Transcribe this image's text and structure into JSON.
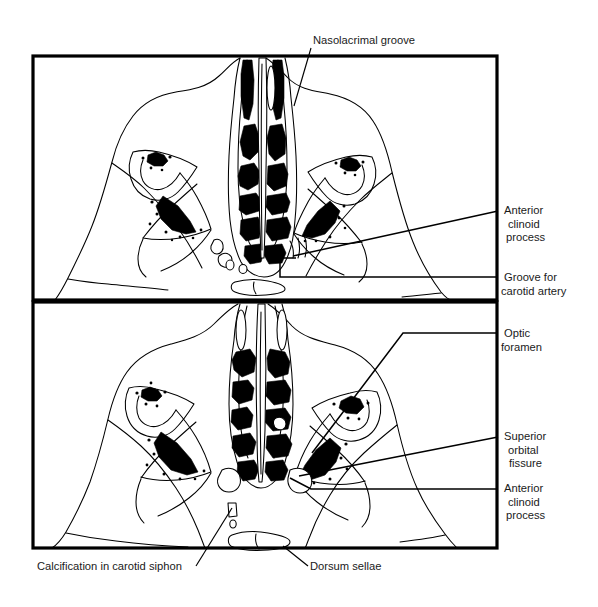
{
  "figure": {
    "background_color": "#ffffff",
    "ink_color": "#000000",
    "panel_count": 2
  },
  "panels": [
    {
      "id": "upper-panel",
      "name": "upper-axial-section",
      "frame": {
        "x": 33,
        "y": 56,
        "width": 464,
        "height": 244
      }
    },
    {
      "id": "lower-panel",
      "name": "lower-axial-section",
      "frame": {
        "x": 33,
        "y": 302,
        "width": 464,
        "height": 246
      }
    }
  ],
  "labels": {
    "nasolacrimal_groove": {
      "text": "Nasolacrimal groove",
      "lines": [
        "Nasolacrimal groove"
      ],
      "anchor": "start",
      "x": 313,
      "y": 44,
      "panel": "upper-panel"
    },
    "anterior_clinoid_process_upper": {
      "text": "Anterior clinoid process",
      "lines": [
        "Anterior",
        "clinoid",
        "process"
      ],
      "anchor": "start",
      "x": 504,
      "y": 214,
      "panel": "upper-panel"
    },
    "groove_for_carotid_artery": {
      "text": "Groove for carotid artery",
      "lines": [
        "Groove for",
        "carotid artery"
      ],
      "anchor": "start",
      "x": 504,
      "y": 281,
      "panel": "upper-panel"
    },
    "optic_foramen": {
      "text": "Optic foramen",
      "lines": [
        "Optic",
        "foramen"
      ],
      "anchor": "start",
      "x": 504,
      "y": 337,
      "panel": "lower-panel"
    },
    "superior_orbital_fissure": {
      "text": "Superior orbital fissure",
      "lines": [
        "Superior",
        "orbital",
        "fissure"
      ],
      "anchor": "start",
      "x": 504,
      "y": 440,
      "panel": "lower-panel"
    },
    "anterior_clinoid_process_lower": {
      "text": "Anterior clinoid process",
      "lines": [
        "Anterior",
        "clinoid",
        "process"
      ],
      "anchor": "start",
      "x": 504,
      "y": 492,
      "panel": "lower-panel"
    },
    "calcification_in_carotid_siphon": {
      "text": "Calcification in carotid siphon",
      "lines": [
        "Calcification in carotid siphon"
      ],
      "anchor": "start",
      "x": 37,
      "y": 570,
      "panel": "lower-panel"
    },
    "dorsum_sellae": {
      "text": "Dorsum sellae",
      "lines": [
        "Dorsum sellae"
      ],
      "anchor": "start",
      "x": 310,
      "y": 570,
      "panel": "lower-panel"
    }
  },
  "leader_lines": {
    "nasolacrimal_groove": "M 311 48 L 294 106",
    "anterior_clinoid_process_upper": "M 498 211 L 293 256",
    "groove_for_carotid_artery": "M 498 277 L 280 277 L 280 258 L 296 258",
    "optic_foramen": "M 498 333 L 403 333 L 312 453",
    "superior_orbital_fissure": "M 498 437 L 299 476",
    "anterior_clinoid_process_lower": "M 498 489 L 311 489 L 290 478",
    "calcification_in_carotid_siphon": "M 196 566 L 232 508",
    "dorsum_sellae": "M 308 566 L 283 546"
  },
  "anatomy_notes": {
    "upper_panel_contents": [
      "frontal-bone-outline",
      "ethmoid-air-cells",
      "nasal-septum",
      "left-orbital-wing",
      "right-orbital-wing",
      "sphenoid-bone-fragments",
      "carotid-groove"
    ],
    "lower_panel_contents": [
      "skull-outline",
      "ethmoid-air-cells",
      "optic-foramen",
      "superior-orbital-fissure",
      "anterior-clinoid-process",
      "carotid-siphon-calcification",
      "dorsum-sellae"
    ]
  }
}
